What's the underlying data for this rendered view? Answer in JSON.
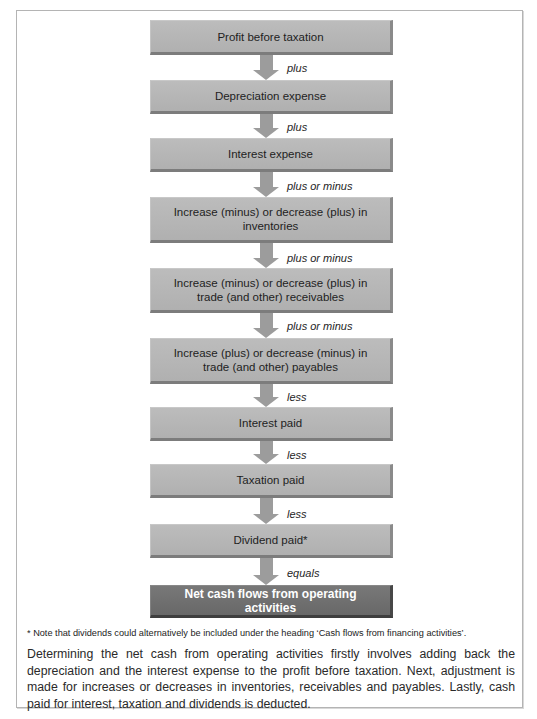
{
  "flowchart": {
    "steps": [
      {
        "label": "Profit before taxation",
        "connector_after": "plus"
      },
      {
        "label": "Depreciation expense",
        "connector_after": "plus"
      },
      {
        "label": "Interest expense",
        "connector_after": "plus or minus"
      },
      {
        "label": "Increase (minus) or decrease (plus) in inventories",
        "connector_after": "plus or minus"
      },
      {
        "label": "Increase (minus) or decrease (plus) in trade (and other) receivables",
        "connector_after": "plus or minus"
      },
      {
        "label": "Increase (plus) or decrease (minus) in trade (and other) payables",
        "connector_after": "less"
      },
      {
        "label": "Interest paid",
        "connector_after": "less"
      },
      {
        "label": "Taxation paid",
        "connector_after": "less"
      },
      {
        "label": "Dividend paid*",
        "connector_after": "equals"
      },
      {
        "label": "Net cash flows from operating activities",
        "connector_after": null
      }
    ],
    "colors": {
      "box": "#b3b3b3",
      "final_box": "#6f6f6f",
      "arrow": "#9c9c9c"
    }
  },
  "footnote": "* Note that dividends could alternatively be included under the heading ‘Cash flows from financing activities’.",
  "caption": "Determining the net cash from operating activities firstly involves adding back the depreciation and the interest expense to the profit before taxation. Next, adjustment is made for increases or decreases in inventories, receivables and payables. Lastly, cash paid for interest, taxation and dividends is deducted.",
  "cutoff_text": "Figure caption line (cut off)"
}
